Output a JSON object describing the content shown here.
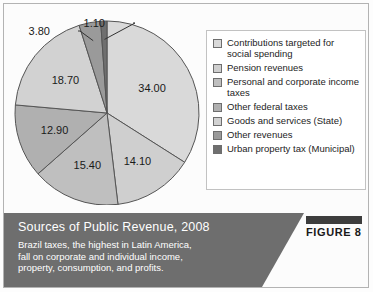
{
  "figure": {
    "tab_bar_label": "figure-tab-bar",
    "tab_label": "FIGURE 8",
    "caption_title": "Sources of Public Revenue, 2008",
    "caption_lines": [
      "Brazil taxes, the highest in Latin America,",
      "fall on corporate and individual income,",
      "property, consumption, and profits."
    ],
    "caption_bg_color": "#6e6e6e",
    "caption_text_color": "#ffffff"
  },
  "legend": {
    "items": [
      {
        "label": "Contributions targeted for social spending",
        "color": "#d9d9d9"
      },
      {
        "label": "Pension revenues",
        "color": "#cfcfcf"
      },
      {
        "label": "Personal and corporate income taxes",
        "color": "#bfbfbf"
      },
      {
        "label": "Other federal taxes",
        "color": "#b0b0b0"
      },
      {
        "label": "Goods and services (State)",
        "color": "#d2d2d2"
      },
      {
        "label": "Other revenues",
        "color": "#9a9a9a"
      },
      {
        "label": "Urban property tax (Municipal)",
        "color": "#6f6f6f"
      }
    ]
  },
  "chart_data": {
    "type": "pie",
    "title": "Sources of Public Revenue, 2008",
    "subtitle": "Brazil taxes, the highest in Latin America, fall on corporate and individual income, property, consumption, and profits.",
    "legend_position": "right",
    "units": "percent",
    "total": 100.0,
    "categories": [
      "Contributions targeted for social spending",
      "Pension revenues",
      "Personal and corporate income taxes",
      "Other federal taxes",
      "Goods and services (State)",
      "Other revenues",
      "Urban property tax (Municipal)"
    ],
    "values": [
      34.0,
      14.1,
      15.4,
      12.9,
      18.7,
      3.8,
      1.1
    ],
    "data_labels": [
      "34.00",
      "14.10",
      "15.40",
      "12.90",
      "18.70",
      "3.80",
      "1.10"
    ],
    "colors": [
      "#d9d9d9",
      "#cfcfcf",
      "#bfbfbf",
      "#b0b0b0",
      "#d2d2d2",
      "#9a9a9a",
      "#6f6f6f"
    ],
    "slice_label_placement": [
      "inside",
      "inside",
      "inside",
      "inside",
      "inside",
      "callout",
      "callout"
    ],
    "start_angle_deg": 0,
    "direction": "clockwise",
    "slice_border_color": "#555555"
  }
}
